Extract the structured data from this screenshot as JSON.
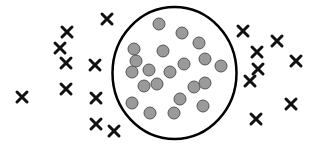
{
  "diagram": {
    "width": 317,
    "height": 146,
    "colors": {
      "background": "#ffffff",
      "boundary_stroke": "#000000",
      "dot_fill": "#9a9a9a",
      "dot_stroke": "#555555",
      "cross_stroke": "#111111"
    },
    "boundary": {
      "shape": "ellipse",
      "cx": 174.5,
      "cy": 73,
      "rx": 62,
      "ry": 66,
      "stroke_width": 2.5
    },
    "dot_radius": 6,
    "cross_size": 5,
    "inside_points": [
      [
        159,
        24
      ],
      [
        182,
        33
      ],
      [
        199,
        43
      ],
      [
        134,
        49
      ],
      [
        163,
        51
      ],
      [
        136,
        61
      ],
      [
        205,
        59
      ],
      [
        184,
        64
      ],
      [
        221,
        66
      ],
      [
        132,
        72
      ],
      [
        149,
        70
      ],
      [
        170,
        72
      ],
      [
        144,
        86
      ],
      [
        157,
        84
      ],
      [
        194,
        87
      ],
      [
        205,
        83
      ],
      [
        180,
        99
      ],
      [
        132,
        103
      ],
      [
        203,
        106
      ],
      [
        150,
        113
      ],
      [
        174,
        113
      ]
    ],
    "outside_points": [
      [
        107,
        19
      ],
      [
        67,
        32
      ],
      [
        60,
        48
      ],
      [
        66,
        63
      ],
      [
        95,
        65
      ],
      [
        66,
        89
      ],
      [
        22,
        97
      ],
      [
        96,
        98
      ],
      [
        96,
        124
      ],
      [
        114,
        131
      ],
      [
        243,
        31
      ],
      [
        277,
        41
      ],
      [
        257,
        52
      ],
      [
        296,
        61
      ],
      [
        258,
        69
      ],
      [
        250,
        81
      ],
      [
        291,
        104
      ],
      [
        256,
        119
      ]
    ]
  }
}
